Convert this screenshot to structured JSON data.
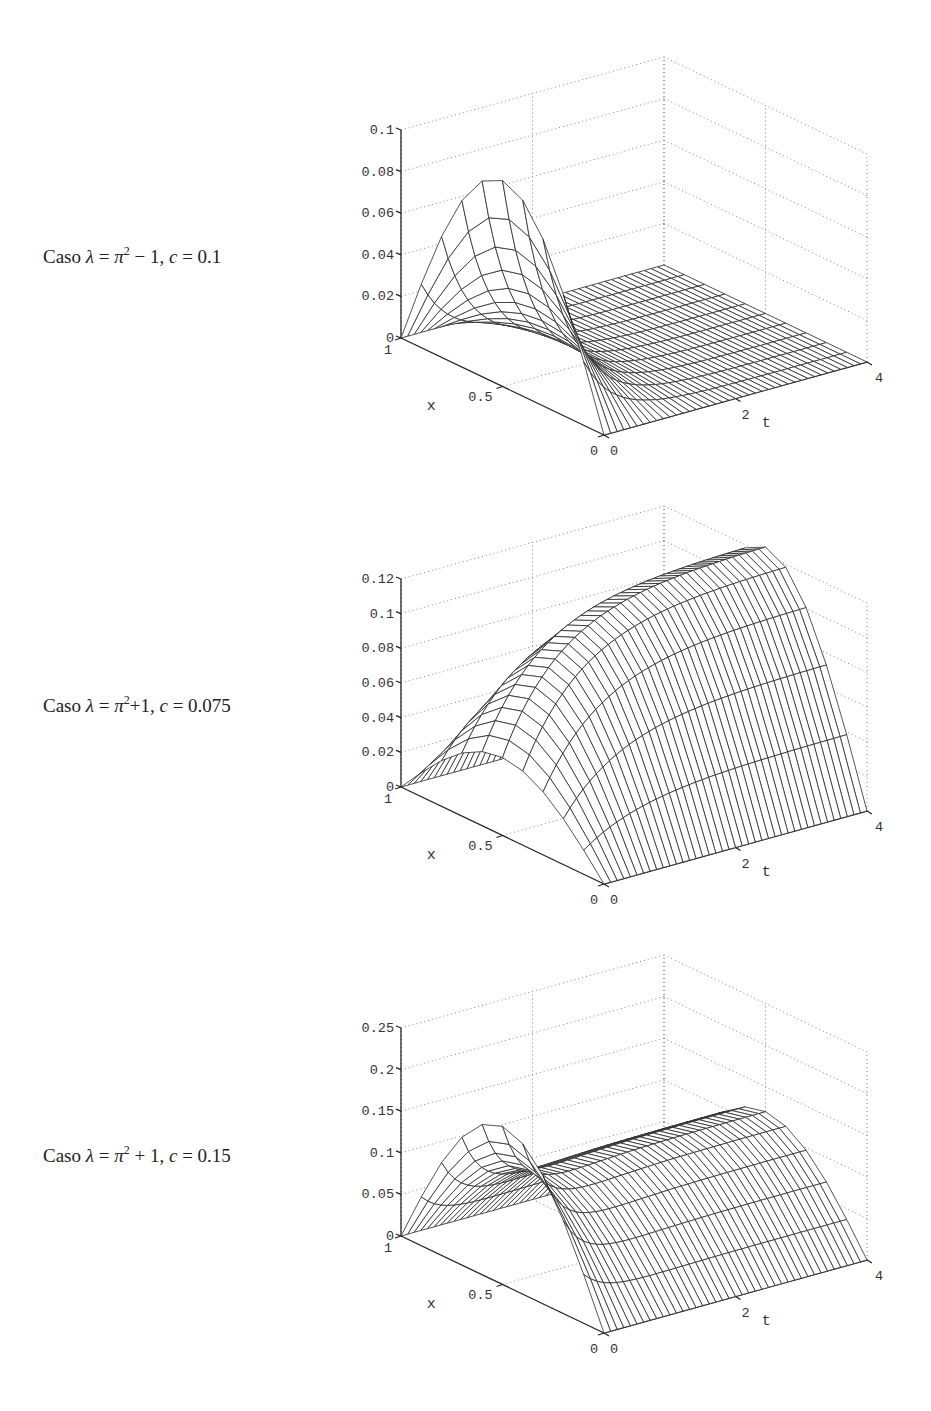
{
  "figure": {
    "panels": [
      {
        "caption": {
          "prefix": "Caso ",
          "lambda_sym": "λ",
          "eq": " = ",
          "pi": "π",
          "exp": "2",
          "rest": " − 1,  ",
          "c_sym": "c",
          "c_eq": " = 0.1"
        },
        "z_ticks": [
          "0",
          "0.02",
          "0.04",
          "0.06",
          "0.08",
          "0.1"
        ],
        "x_ticks": [
          "1",
          "0.5",
          "0"
        ],
        "t_ticks": [
          "0",
          "2",
          "4"
        ],
        "x_label": "x",
        "t_label": "t"
      },
      {
        "caption": {
          "prefix": "Caso ",
          "lambda_sym": "λ",
          "eq": " = ",
          "pi": "π",
          "exp": "2",
          "rest": "+1,  ",
          "c_sym": "c",
          "c_eq": " = 0.075"
        },
        "z_ticks": [
          "0",
          "0.02",
          "0.04",
          "0.06",
          "0.08",
          "0.1",
          "0.12"
        ],
        "x_ticks": [
          "1",
          "0.5",
          "0"
        ],
        "t_ticks": [
          "0",
          "2",
          "4"
        ],
        "x_label": "x",
        "t_label": "t"
      },
      {
        "caption": {
          "prefix": "Caso ",
          "lambda_sym": "λ",
          "eq": " = ",
          "pi": "π",
          "exp": "2",
          "rest": " + 1,  ",
          "c_sym": "c",
          "c_eq": " = 0.15"
        },
        "z_ticks": [
          "0",
          "0.05",
          "0.1",
          "0.15",
          "0.2",
          "0.25"
        ],
        "x_ticks": [
          "1",
          "0.5",
          "0"
        ],
        "t_ticks": [
          "0",
          "2",
          "4"
        ],
        "x_label": "x",
        "t_label": "t"
      }
    ]
  },
  "chart_data": [
    {
      "type": "surface",
      "title": "Caso λ = π² − 1, c = 0.1",
      "xlabel": "x",
      "ylabel": "t",
      "zlabel": "",
      "x_range": [
        0,
        1
      ],
      "t_range": [
        0,
        4
      ],
      "zlim": [
        0,
        0.1
      ],
      "x_ticks": [
        0,
        0.5,
        1
      ],
      "t_ticks": [
        0,
        2,
        4
      ],
      "z_ticks": [
        0,
        0.02,
        0.04,
        0.06,
        0.08,
        0.1
      ],
      "grid": true,
      "mesh": {
        "x_samples": 11,
        "t_samples": 41
      },
      "model": {
        "initial_amplitude": 0.099,
        "decay_rate": 2.2,
        "steady_amplitude": 0.0,
        "growth_rate": 0.0
      },
      "description": "Initial sine-like profile (peak ≈0.099 at x≈0.5, t=0) decaying to ≈0 for t > 1.5"
    },
    {
      "type": "surface",
      "title": "Caso λ = π²+1, c = 0.075",
      "xlabel": "x",
      "ylabel": "t",
      "zlabel": "",
      "x_range": [
        0,
        1
      ],
      "t_range": [
        0,
        4
      ],
      "zlim": [
        0,
        0.12
      ],
      "x_ticks": [
        0,
        0.5,
        1
      ],
      "t_ticks": [
        0,
        2,
        4
      ],
      "z_ticks": [
        0,
        0.02,
        0.04,
        0.06,
        0.08,
        0.1,
        0.12
      ],
      "grid": true,
      "mesh": {
        "x_samples": 11,
        "t_samples": 41
      },
      "model": {
        "initial_amplitude": 0.045,
        "decay_rate": 1.0,
        "steady_amplitude": 0.125,
        "growth_rate": 0.55
      },
      "description": "Profile grows monotonically in t toward a ridge ≈0.12 at t=4"
    },
    {
      "type": "surface",
      "title": "Caso λ = π² + 1, c = 0.15",
      "xlabel": "x",
      "ylabel": "t",
      "zlabel": "",
      "x_range": [
        0,
        1
      ],
      "t_range": [
        0,
        4
      ],
      "zlim": [
        0,
        0.25
      ],
      "x_ticks": [
        0,
        0.5,
        1
      ],
      "t_ticks": [
        0,
        2,
        4
      ],
      "z_ticks": [
        0,
        0.05,
        0.1,
        0.15,
        0.2,
        0.25
      ],
      "grid": true,
      "mesh": {
        "x_samples": 11,
        "t_samples": 41
      },
      "model": {
        "initial_amplitude": 0.19,
        "decay_rate": 2.6,
        "steady_amplitude": 0.12,
        "growth_rate": 0.9
      },
      "description": "Initial peak ≈0.19 decays then settles to ridge ≈0.12 for large t"
    }
  ]
}
